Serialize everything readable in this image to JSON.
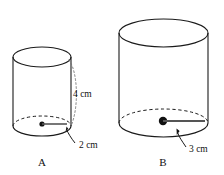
{
  "figure": {
    "type": "geometry-diagram",
    "background_color": "#ffffff",
    "line_color": "#1a1a1a",
    "text_color": "#111111"
  },
  "cylinders": [
    {
      "id": "A",
      "name": "cylinder-a",
      "label": "A",
      "label_x": 42,
      "label_y": 164,
      "left_x": 12,
      "right_x": 70,
      "top_center_y": 57,
      "bottom_center_y": 126,
      "ellipse_rx": 29,
      "ellipse_ry": 10,
      "center_dot_x": 42,
      "center_dot_y": 124,
      "center_dot_r": 2.6,
      "radius_line_to_x": 68,
      "radius_label": "2 cm",
      "radius_label_x": 79,
      "radius_label_y": 148,
      "radius_value": 2,
      "height_label": "4 cm",
      "height_label_x": 73,
      "height_label_y": 97,
      "height_value": 4,
      "unit": "cm",
      "has_height_annotation": true
    },
    {
      "id": "B",
      "name": "cylinder-b",
      "label": "B",
      "label_x": 163,
      "label_y": 164,
      "left_x": 119,
      "right_x": 208,
      "top_center_y": 33,
      "bottom_center_y": 123,
      "ellipse_rx": 44.5,
      "ellipse_ry": 14,
      "center_dot_x": 163,
      "center_dot_y": 121,
      "center_dot_r": 4.2,
      "radius_line_to_x": 206,
      "radius_label": "3 cm",
      "radius_label_x": 189,
      "radius_label_y": 152,
      "radius_value": 3,
      "height_label": "",
      "unit": "cm",
      "has_height_annotation": false
    }
  ],
  "annotations": {
    "height_arc_label": "4 cm",
    "radius_a_label": "2 cm",
    "radius_b_label": "3 cm",
    "figure_label_a": "A",
    "figure_label_b": "B"
  }
}
